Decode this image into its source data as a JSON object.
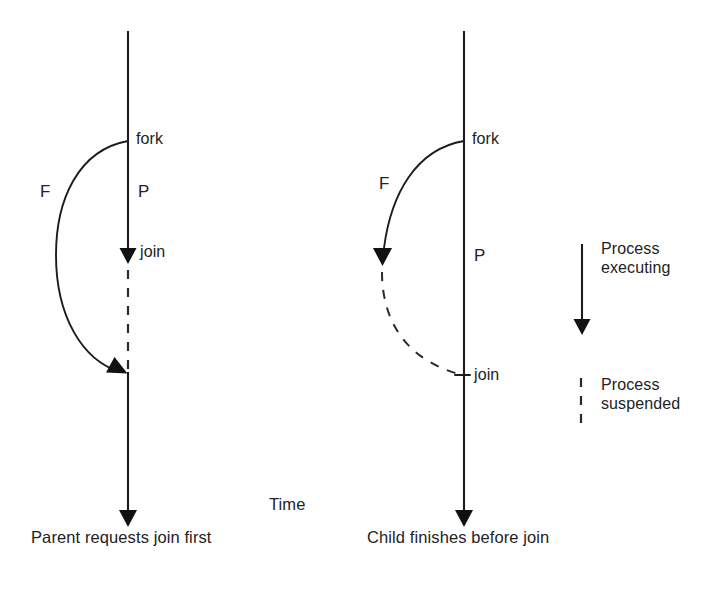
{
  "figure": {
    "title_caption_left": "Parent requests join first",
    "title_caption_right": "Child finishes before join",
    "time_axis_label": "Time",
    "colors": {
      "line": "#1c1c1c",
      "dashed": "#2a2a2a",
      "text": "#232323",
      "background": "#ffffff"
    }
  },
  "diagram_left": {
    "name": "parent-requests-join-first",
    "caption": "Parent requests join first",
    "parent_label": "P",
    "child_label": "F",
    "fork_label": "fork",
    "join_label": "join",
    "parent_state_after_join": "suspended",
    "child_state": "executing",
    "sequence": [
      "parent executes",
      "fork",
      "parent reaches join and suspends",
      "child continues executing",
      "child finishes and rejoins parent",
      "parent resumes executing"
    ]
  },
  "diagram_right": {
    "name": "child-finishes-before-join",
    "caption": "Child finishes before join",
    "parent_label": "P",
    "child_label": "F",
    "fork_label": "fork",
    "join_label": "join",
    "parent_state_after_join": "executing",
    "child_state": "suspended after finishing",
    "sequence": [
      "parent executes",
      "fork",
      "child executes and finishes",
      "child suspended waiting",
      "parent reaches join",
      "parent continues executing"
    ]
  },
  "legend": {
    "items": [
      {
        "icon": "solid-arrow-icon",
        "label_line1": "Process",
        "label_line2": "executing",
        "style": "solid"
      },
      {
        "icon": "dashed-line-icon",
        "label_line1": "Process",
        "label_line2": "suspended",
        "style": "dashed"
      }
    ]
  }
}
